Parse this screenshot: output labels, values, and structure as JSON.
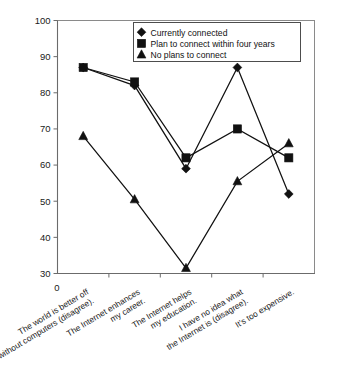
{
  "chart_data": {
    "type": "line",
    "title": "",
    "xlabel": "",
    "ylabel": "",
    "ylim": [
      30,
      100
    ],
    "ytick_step": 10,
    "yticks": [
      30,
      40,
      50,
      60,
      70,
      80,
      90,
      100
    ],
    "origin_label": "0",
    "grid": false,
    "legend_position": "top-center",
    "categories": [
      "The world is better off without computers (disagree).",
      "The Internet enhances my career.",
      "The Internet helps my education.",
      "I have no idea what the Internet is (disagree).",
      "It's too expensive."
    ],
    "category_lines": [
      [
        "The world is better off",
        "without computers (disagree)."
      ],
      [
        "The Internet enhances",
        "my career."
      ],
      [
        "The Internet helps",
        "my education."
      ],
      [
        "I have no idea what",
        "the Internet is (disagree)."
      ],
      [
        "It's too expensive.",
        ""
      ]
    ],
    "series": [
      {
        "name": "Currently connected",
        "marker": "diamond",
        "values": [
          87,
          82,
          59,
          87,
          52
        ]
      },
      {
        "name": "Plan to connect within four years",
        "marker": "square",
        "values": [
          87,
          83,
          62,
          70,
          62
        ]
      },
      {
        "name": "No plans to connect",
        "marker": "triangle",
        "values": [
          68,
          50.5,
          31.5,
          55.5,
          66
        ]
      }
    ]
  },
  "legend": {
    "entries": [
      {
        "label": "Currently connected",
        "marker": "diamond"
      },
      {
        "label": "Plan to connect within four years",
        "marker": "square"
      },
      {
        "label": "No plans to connect",
        "marker": "triangle"
      }
    ]
  },
  "colors": {
    "series": "#111111",
    "axis": "#6b6b6b",
    "frame": "#8a8a8a",
    "background": "#ffffff"
  }
}
